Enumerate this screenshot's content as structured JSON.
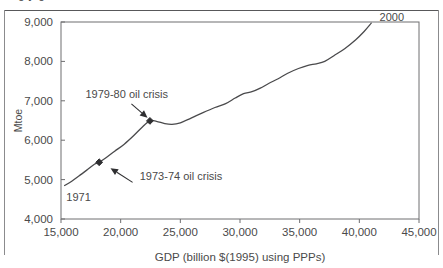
{
  "figure": {
    "clipped_title_fragment": "g y g",
    "background_color": "#ffffff",
    "frame_color": "#6e6e70",
    "line_color": "#4a4a4c",
    "text_color": "#4a4a4a"
  },
  "chart_data": {
    "type": "line",
    "title": "",
    "xlabel": "GDP (billion $(1995) using PPPs)",
    "ylabel": "Mtoe",
    "xlim": [
      15000,
      45000
    ],
    "ylim": [
      4000,
      9000
    ],
    "xticks": [
      15000,
      20000,
      25000,
      30000,
      35000,
      40000,
      45000
    ],
    "xtick_labels": [
      "15,000",
      "20,000",
      "25,000",
      "30,000",
      "35,000",
      "40,000",
      "45,000"
    ],
    "yticks": [
      4000,
      5000,
      6000,
      7000,
      8000,
      9000
    ],
    "ytick_labels": [
      "4,000",
      "5,000",
      "6,000",
      "7,000",
      "8,000",
      "9,000"
    ],
    "grid": false,
    "legend": "none",
    "series": [
      {
        "name": "World primary energy supply vs GDP",
        "x": [
          15300,
          15900,
          16500,
          17200,
          17800,
          18200,
          18800,
          19500,
          20300,
          21100,
          21800,
          22450,
          23000,
          23700,
          24300,
          25000,
          25900,
          26900,
          27900,
          28800,
          29600,
          30300,
          31000,
          31700,
          32400,
          33200,
          34000,
          34900,
          35700,
          36400,
          37100,
          37900,
          38800,
          39700,
          40400,
          41000
        ],
        "y": [
          4850,
          4960,
          5090,
          5250,
          5390,
          5440,
          5560,
          5720,
          5900,
          6120,
          6330,
          6490,
          6480,
          6420,
          6400,
          6440,
          6560,
          6700,
          6830,
          6930,
          7070,
          7180,
          7230,
          7320,
          7440,
          7560,
          7700,
          7820,
          7900,
          7940,
          8000,
          8150,
          8330,
          8550,
          8760,
          8970
        ]
      }
    ],
    "markers": [
      {
        "name": "1973-74 oil crisis marker",
        "x": 18200,
        "y": 5440
      },
      {
        "name": "1979-80 oil crisis marker",
        "x": 22450,
        "y": 6490
      }
    ],
    "annotations": [
      {
        "name": "annotation-1979-80-oil-crisis",
        "text": "1979-80 oil crisis",
        "text_x": 17050,
        "text_y": 7080,
        "arrow_from_x": 20900,
        "arrow_from_y": 6920,
        "arrow_to_x": 22250,
        "arrow_to_y": 6570
      },
      {
        "name": "annotation-1973-74-oil-crisis",
        "text": "1973-74 oil crisis",
        "text_x": 21600,
        "text_y": 5000,
        "arrow_from_x": 21000,
        "arrow_from_y": 4930,
        "arrow_to_x": 19150,
        "arrow_to_y": 5290
      },
      {
        "name": "annotation-start-year",
        "text": "1971",
        "text_x": 15450,
        "text_y": 4460
      },
      {
        "name": "annotation-end-year",
        "text": "2000",
        "text_x": 41700,
        "text_y": 9020
      }
    ]
  }
}
